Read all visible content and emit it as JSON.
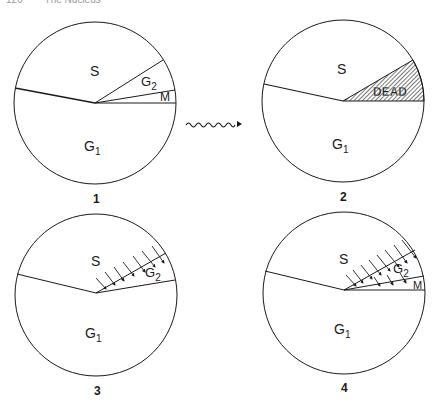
{
  "header": {
    "page_number": "126",
    "running_title": "The Nucleus"
  },
  "panels": [
    {
      "id": "1",
      "caption": "1",
      "sectors": [
        {
          "label": "S",
          "sub": ""
        },
        {
          "label": "G",
          "sub": "2"
        },
        {
          "label": "M",
          "sub": ""
        },
        {
          "label": "G",
          "sub": "1"
        }
      ]
    },
    {
      "id": "2",
      "caption": "2",
      "sectors": [
        {
          "label": "S",
          "sub": ""
        },
        {
          "label": "DEAD",
          "sub": "",
          "hatched": true
        },
        {
          "label": "G",
          "sub": "1"
        }
      ]
    },
    {
      "id": "3",
      "caption": "3",
      "sectors": [
        {
          "label": "S",
          "sub": ""
        },
        {
          "label": "G",
          "sub": "2",
          "arrows": true
        },
        {
          "label": "G",
          "sub": "1"
        }
      ]
    },
    {
      "id": "4",
      "caption": "4",
      "sectors": [
        {
          "label": "S",
          "sub": ""
        },
        {
          "label": "G",
          "sub": "2",
          "arrows": true
        },
        {
          "label": "M",
          "sub": "",
          "arrows": true
        },
        {
          "label": "G",
          "sub": "1"
        }
      ]
    }
  ],
  "transition_arrow": {
    "icon": "wavy-arrow-icon",
    "meaning": "irradiation/treatment"
  },
  "colors": {
    "stroke": "#1a1a1a",
    "background": "#ffffff",
    "header": "#9a9a9a"
  }
}
